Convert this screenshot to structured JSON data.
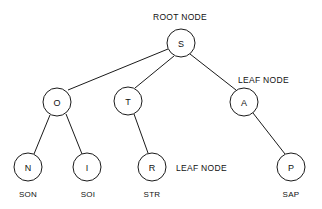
{
  "diagram": {
    "background_color": "#ffffff",
    "stroke_color": "#1a1a1a",
    "text_color": "#111111",
    "node_radius": 14,
    "nodes": [
      {
        "id": "S",
        "label": "S",
        "cx": 181,
        "cy": 43,
        "role": "root"
      },
      {
        "id": "O",
        "label": "O",
        "cx": 57,
        "cy": 102,
        "role": "internal"
      },
      {
        "id": "T",
        "label": "T",
        "cx": 128,
        "cy": 101,
        "role": "internal"
      },
      {
        "id": "A",
        "label": "A",
        "cx": 244,
        "cy": 102,
        "role": "internal"
      },
      {
        "id": "N",
        "label": "N",
        "cx": 28,
        "cy": 167,
        "role": "leaf"
      },
      {
        "id": "I",
        "label": "I",
        "cx": 87,
        "cy": 167,
        "role": "leaf"
      },
      {
        "id": "R",
        "label": "R",
        "cx": 152,
        "cy": 167,
        "role": "leaf"
      },
      {
        "id": "P",
        "label": "P",
        "cx": 291,
        "cy": 167,
        "role": "leaf"
      }
    ],
    "edges": [
      {
        "from": "S",
        "to": "O",
        "x1": 168,
        "y1": 49,
        "x2": 68,
        "y2": 90
      },
      {
        "from": "S",
        "to": "T",
        "x1": 174,
        "y1": 56,
        "x2": 135,
        "y2": 88
      },
      {
        "from": "S",
        "to": "A",
        "x1": 190,
        "y1": 54,
        "x2": 236,
        "y2": 90
      },
      {
        "from": "O",
        "to": "N",
        "x1": 50,
        "y1": 115,
        "x2": 34,
        "y2": 154
      },
      {
        "from": "O",
        "to": "I",
        "x1": 66,
        "y1": 114,
        "x2": 82,
        "y2": 154
      },
      {
        "from": "T",
        "to": "R",
        "x1": 134,
        "y1": 114,
        "x2": 148,
        "y2": 153
      },
      {
        "from": "A",
        "to": "P",
        "x1": 253,
        "y1": 113,
        "x2": 285,
        "y2": 154
      }
    ],
    "annotations": [
      {
        "id": "root-node-label",
        "text": "ROOT NODE",
        "x": 153,
        "y": 20,
        "anchor": "start"
      },
      {
        "id": "leaf-node-label-right",
        "text": "LEAF NODE",
        "x": 238,
        "y": 83,
        "anchor": "start"
      },
      {
        "id": "leaf-node-label-middle",
        "text": "LEAF NODE",
        "x": 176,
        "y": 171,
        "anchor": "start"
      }
    ],
    "word_labels": [
      {
        "id": "word-son",
        "text": "SON",
        "x": 28,
        "y": 197
      },
      {
        "id": "word-soi",
        "text": "SOI",
        "x": 88,
        "y": 197
      },
      {
        "id": "word-str",
        "text": "STR",
        "x": 152,
        "y": 197
      },
      {
        "id": "word-sap",
        "text": "SAP",
        "x": 291,
        "y": 197
      }
    ]
  }
}
